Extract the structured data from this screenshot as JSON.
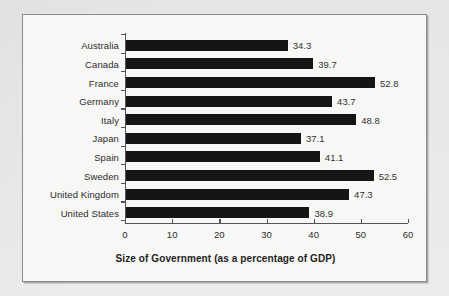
{
  "chart_data": {
    "type": "bar",
    "orientation": "horizontal",
    "title": "",
    "xlabel": "Size of Government (as a percentage of GDP)",
    "ylabel": "",
    "categories": [
      "Australia",
      "Canada",
      "France",
      "Germany",
      "Italy",
      "Japan",
      "Spain",
      "Sweden",
      "United Kingdom",
      "United States"
    ],
    "values": [
      34.3,
      39.7,
      52.8,
      43.7,
      48.8,
      37.1,
      41.1,
      52.5,
      47.3,
      38.9
    ],
    "value_labels": [
      "34.3",
      "39.7",
      "52.8",
      "43.7",
      "48.8",
      "37.1",
      "41.1",
      "52.5",
      "47.3",
      "38.9"
    ],
    "xlim": [
      0,
      60
    ],
    "xticks": [
      0,
      10,
      20,
      30,
      40,
      50,
      60
    ],
    "xtick_labels": [
      "0",
      "10",
      "20",
      "30",
      "40",
      "50",
      "60"
    ],
    "grid": false,
    "legend": false,
    "bar_color": "#151515",
    "axis_color": "#555555",
    "text_color": "#2c2c2c",
    "frame_color": "#8b8b8b",
    "plot_background": "#f7f7f5",
    "page_background": "#e8e8e6"
  }
}
